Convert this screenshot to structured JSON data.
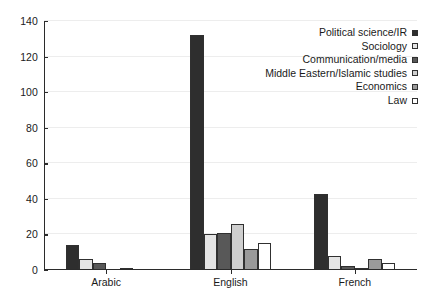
{
  "chart_data": {
    "type": "bar",
    "title": "",
    "xlabel": "",
    "ylabel": "",
    "ylim": [
      0,
      140
    ],
    "yticks": [
      0,
      20,
      40,
      60,
      80,
      100,
      120,
      140
    ],
    "grid": true,
    "legend_position": "top-right",
    "categories": [
      "Arabic",
      "English",
      "French"
    ],
    "series": [
      {
        "name": "Political science/IR",
        "color": "#2e2e2e",
        "values": [
          14,
          132,
          43
        ]
      },
      {
        "name": "Sociology",
        "color": "#e4e4e4",
        "values": [
          6,
          20,
          8
        ]
      },
      {
        "name": "Communication/media",
        "color": "#585858",
        "values": [
          4,
          21,
          2
        ]
      },
      {
        "name": "Middle Eastern/Islamic studies",
        "color": "#cfcfcf",
        "values": [
          0,
          26,
          1
        ]
      },
      {
        "name": "Economics",
        "color": "#9a9a9a",
        "values": [
          1,
          12,
          6
        ]
      },
      {
        "name": "Law",
        "color": "#ffffff",
        "values": [
          0,
          15,
          4
        ]
      }
    ]
  },
  "axis": {
    "y_tick_labels": [
      "0",
      "20",
      "40",
      "60",
      "80",
      "100",
      "120",
      "140"
    ],
    "x_tick_labels": [
      "Arabic",
      "English",
      "French"
    ]
  },
  "legend": {
    "entries": [
      {
        "label": "Political science/IR",
        "swatch": "legend-swatch-political-science"
      },
      {
        "label": "Sociology",
        "swatch": "legend-swatch-sociology"
      },
      {
        "label": "Communication/media",
        "swatch": "legend-swatch-communication-media"
      },
      {
        "label": "Middle Eastern/Islamic studies",
        "swatch": "legend-swatch-middle-eastern-islamic-studies"
      },
      {
        "label": "Economics",
        "swatch": "legend-swatch-economics"
      },
      {
        "label": "Law",
        "swatch": "legend-swatch-law"
      }
    ]
  }
}
